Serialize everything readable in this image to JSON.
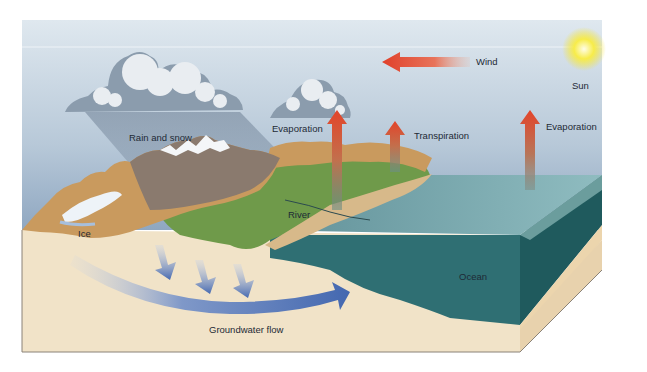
{
  "diagram": {
    "labels": {
      "wind": "Wind",
      "sun": "Sun",
      "rain_and_snow": "Rain and snow",
      "evaporation_land": "Evaporation",
      "transpiration": "Transpiration",
      "evaporation_ocean": "Evaporation",
      "river": "River",
      "ice": "Ice",
      "ocean": "Ocean",
      "groundwater_flow": "Groundwater flow"
    },
    "colors": {
      "sky_top": "#cfdde8",
      "sky_bottom": "#8ea6c0",
      "ground": "#f1e3c8",
      "ocean_surface": "#6f9aa3",
      "ocean_front": "#2f6f73",
      "ocean_side": "#1f5a5d",
      "vegetation": "#6f9a4a",
      "mountain": "#c99a5e",
      "arrow_red": "#e2452a",
      "groundwater_blue": "#4a6fb3",
      "sun_yellow": "#f5e33a"
    }
  }
}
